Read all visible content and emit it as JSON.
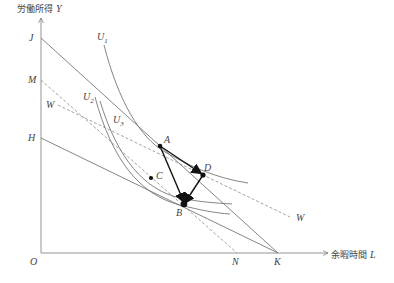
{
  "diagram": {
    "title": "",
    "axes": {
      "y_label_jp": "労働所得",
      "y_label_var": "Y",
      "x_label_jp": "余暇時間",
      "x_label_var": "L",
      "origin": "O"
    },
    "axis_points": {
      "J": "J",
      "M": "M",
      "H": "H",
      "N": "N",
      "K": "K"
    },
    "lines": {
      "W_left": "W",
      "W_right": "W"
    },
    "curves": {
      "U1": "U",
      "U1_sub": "1",
      "U2": "U",
      "U2_sub": "2",
      "U3": "U",
      "U3_sub": "3"
    },
    "points": {
      "A": "A",
      "B": "B",
      "C": "C",
      "D": "D"
    },
    "colors": {
      "line": "#777777",
      "dashed": "#888888",
      "arrow": "#111111",
      "text": "#444444"
    }
  }
}
